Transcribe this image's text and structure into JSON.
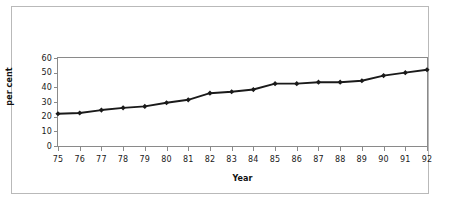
{
  "chart_data": {
    "type": "line",
    "title": "",
    "xlabel": "Year",
    "ylabel": "per cent",
    "categories": [
      "75",
      "76",
      "77",
      "78",
      "79",
      "80",
      "81",
      "82",
      "83",
      "84",
      "85",
      "86",
      "87",
      "88",
      "89",
      "90",
      "91",
      "92"
    ],
    "values": [
      22,
      22.5,
      24.5,
      26,
      27,
      29.5,
      31.5,
      36,
      37,
      38.5,
      42.5,
      42.5,
      43.5,
      43.5,
      44.5,
      48,
      50,
      52
    ],
    "series": [
      {
        "name": "per cent",
        "values": [
          22,
          22.5,
          24.5,
          26,
          27,
          29.5,
          31.5,
          36,
          37,
          38.5,
          42.5,
          42.5,
          43.5,
          43.5,
          44.5,
          48,
          50,
          52
        ]
      }
    ],
    "ylim": [
      0,
      60
    ],
    "yticks": [
      0,
      10,
      20,
      30,
      40,
      50,
      60
    ],
    "ytick_labels": [
      "0",
      "10",
      "20",
      "30",
      "40",
      "50",
      "60"
    ],
    "xtick_labels": [
      "75",
      "76",
      "77",
      "78",
      "79",
      "80",
      "81",
      "82",
      "83",
      "84",
      "85",
      "86",
      "87",
      "88",
      "89",
      "90",
      "91",
      "92"
    ],
    "grid": false,
    "legend": false,
    "legend_position": "none",
    "marker": "diamond",
    "line_color": "#1a1a1a",
    "marker_color": "#1a1a1a",
    "plot_border_color": "#8a8a8a",
    "frame_border_color": "#b9b9b9",
    "background_color": "#ffffff"
  }
}
